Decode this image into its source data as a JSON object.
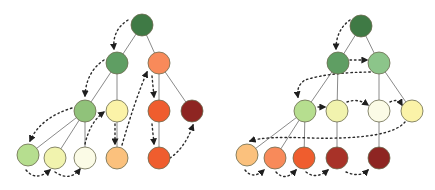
{
  "diagram": {
    "title": "",
    "node_radius": 11,
    "edge_color": "#8a8a8a",
    "traversal_color": "#2a2a2a",
    "node_stroke": "#6b6b4f",
    "trees": [
      {
        "name": "depth-first-tree",
        "nodes": [
          {
            "id": "a",
            "x": 142,
            "y": 25,
            "color": "#3f7a45"
          },
          {
            "id": "b",
            "x": 117,
            "y": 63,
            "color": "#5f9e63"
          },
          {
            "id": "c",
            "x": 159,
            "y": 63,
            "color": "#f88a5a"
          },
          {
            "id": "d",
            "x": 85,
            "y": 111,
            "color": "#90c27a"
          },
          {
            "id": "e",
            "x": 117,
            "y": 111,
            "color": "#fbf3a8"
          },
          {
            "id": "f",
            "x": 159,
            "y": 111,
            "color": "#ef5d2e"
          },
          {
            "id": "g",
            "x": 192,
            "y": 111,
            "color": "#8e2522"
          },
          {
            "id": "h",
            "x": 28,
            "y": 155,
            "color": "#b6de8f"
          },
          {
            "id": "i",
            "x": 55,
            "y": 158,
            "color": "#f1f3ae"
          },
          {
            "id": "j",
            "x": 85,
            "y": 158,
            "color": "#fbfbe6"
          },
          {
            "id": "k",
            "x": 117,
            "y": 158,
            "color": "#fbc17d"
          },
          {
            "id": "l",
            "x": 159,
            "y": 158,
            "color": "#ef5d2e"
          }
        ],
        "edges": [
          [
            "a",
            "b"
          ],
          [
            "a",
            "c"
          ],
          [
            "b",
            "d"
          ],
          [
            "b",
            "e"
          ],
          [
            "c",
            "f"
          ],
          [
            "c",
            "g"
          ],
          [
            "d",
            "h"
          ],
          [
            "d",
            "i"
          ],
          [
            "d",
            "j"
          ],
          [
            "e",
            "k"
          ],
          [
            "f",
            "l"
          ]
        ],
        "traversal": [
          {
            "path": "M128,20 Q112,30 114,49"
          },
          {
            "path": "M104,60 Q86,72 85,96"
          },
          {
            "path": "M72,108 Q40,118 30,141"
          },
          {
            "path": "M26,170 Q36,182 50,170"
          },
          {
            "path": "M55,172 Q70,182 80,169"
          },
          {
            "path": "M85,144 Q90,122 104,112"
          },
          {
            "path": "M115,124 L115,144"
          },
          {
            "path": "M122,145 Q135,100 147,72"
          },
          {
            "path": "M152,76 L154,97"
          },
          {
            "path": "M152,124 L154,144"
          },
          {
            "path": "M170,158 Q185,148 193,125"
          }
        ]
      },
      {
        "name": "breadth-first-tree",
        "nodes": [
          {
            "id": "a",
            "x": 361,
            "y": 26,
            "color": "#3f7a45"
          },
          {
            "id": "b",
            "x": 338,
            "y": 63,
            "color": "#5f9e63"
          },
          {
            "id": "c",
            "x": 379,
            "y": 63,
            "color": "#8cc58a"
          },
          {
            "id": "d",
            "x": 305,
            "y": 111,
            "color": "#b6de8f"
          },
          {
            "id": "e",
            "x": 337,
            "y": 111,
            "color": "#f1f3ae"
          },
          {
            "id": "f",
            "x": 379,
            "y": 111,
            "color": "#fbfbe6"
          },
          {
            "id": "g",
            "x": 412,
            "y": 111,
            "color": "#fbf3a8"
          },
          {
            "id": "h",
            "x": 247,
            "y": 155,
            "color": "#fbc17d"
          },
          {
            "id": "i",
            "x": 275,
            "y": 158,
            "color": "#f88a5a"
          },
          {
            "id": "j",
            "x": 304,
            "y": 158,
            "color": "#ef5d2e"
          },
          {
            "id": "k",
            "x": 337,
            "y": 158,
            "color": "#a83228"
          },
          {
            "id": "l",
            "x": 379,
            "y": 158,
            "color": "#8e2522"
          }
        ],
        "edges": [
          [
            "a",
            "b"
          ],
          [
            "a",
            "c"
          ],
          [
            "b",
            "d"
          ],
          [
            "b",
            "e"
          ],
          [
            "c",
            "f"
          ],
          [
            "c",
            "g"
          ],
          [
            "d",
            "h"
          ],
          [
            "d",
            "i"
          ],
          [
            "d",
            "j"
          ],
          [
            "e",
            "k"
          ],
          [
            "f",
            "l"
          ]
        ],
        "traversal": [
          {
            "path": "M350,20 Q336,30 336,49"
          },
          {
            "path": "M350,60 L367,60"
          },
          {
            "path": "M375,72 Q330,72 305,80 Q296,86 298,97"
          },
          {
            "path": "M318,107 L325,107"
          },
          {
            "path": "M347,102 Q358,98 368,105"
          },
          {
            "path": "M390,102 Q398,98 402,105"
          },
          {
            "path": "M405,122 Q390,140 310,138 Q265,136 250,141"
          },
          {
            "path": "M245,170 Q253,180 264,170"
          },
          {
            "path": "M276,172 Q285,182 296,170"
          },
          {
            "path": "M306,172 Q316,180 328,170"
          },
          {
            "path": "M346,172 Q360,178 368,170"
          }
        ]
      }
    ]
  }
}
